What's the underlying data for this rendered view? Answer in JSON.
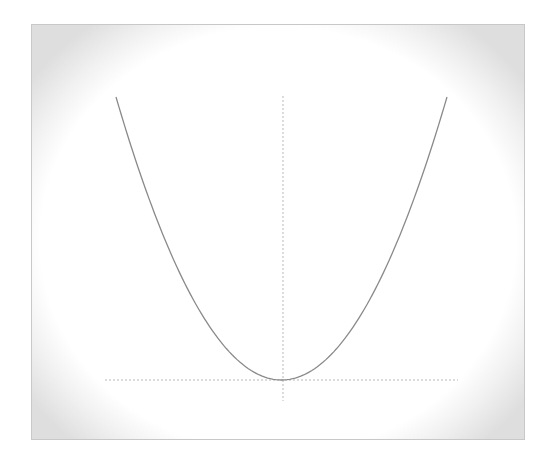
{
  "chart_data": {
    "type": "line",
    "title": "",
    "xlabel": "",
    "ylabel": "",
    "function": "y = x^2",
    "x": [
      -1.0,
      -0.75,
      -0.5,
      -0.25,
      0.0,
      0.25,
      0.5,
      0.75,
      1.0
    ],
    "series": [
      {
        "name": "parabola",
        "values": [
          1.0,
          0.5625,
          0.25,
          0.0625,
          0.0,
          0.0625,
          0.25,
          0.5625,
          1.0
        ]
      }
    ],
    "xlim": [
      -1.07,
      1.07
    ],
    "ylim": [
      -0.07,
      1.0
    ],
    "axes": {
      "x_axis_style": "dotted",
      "y_axis_style": "dotted",
      "ticks": "none",
      "tick_labels": "none"
    },
    "grid": false,
    "legend": "none",
    "colors": {
      "curve": "#8a8a8a",
      "axes": "#b8b8b8",
      "frame_border": "#c8c8c8",
      "vignette": "#dedede"
    }
  }
}
